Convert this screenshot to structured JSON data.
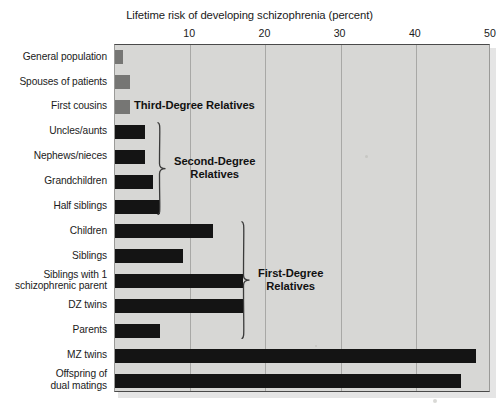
{
  "chart_data": {
    "type": "bar",
    "orientation": "horizontal",
    "title": "Lifetime risk of developing schizophrenia (percent)",
    "xlabel": "Lifetime risk of developing schizophrenia (percent)",
    "ylabel": "",
    "xlim": [
      0,
      50
    ],
    "xticks": [
      10,
      20,
      30,
      40,
      50
    ],
    "xtick_labels": [
      "10",
      "20",
      "30",
      "40",
      "50"
    ],
    "grid": true,
    "legend": "none",
    "categories": [
      "General population",
      "Spouses of patients",
      "First cousins",
      "Uncles/aunts",
      "Nephews/nieces",
      "Grandchildren",
      "Half siblings",
      "Children",
      "Siblings",
      "Siblings with 1\nschizophrenic parent",
      "DZ twins",
      "Parents",
      "MZ twins",
      "Offspring of\ndual matings"
    ],
    "values": [
      1,
      2,
      2,
      4,
      4,
      5,
      6,
      13,
      9,
      17,
      17,
      6,
      48,
      46
    ],
    "bar_colors": [
      "#767674",
      "#767674",
      "#767674",
      "#141414",
      "#141414",
      "#141414",
      "#141414",
      "#141414",
      "#141414",
      "#141414",
      "#141414",
      "#141414",
      "#141414",
      "#141414"
    ],
    "annotations": [
      {
        "label": "Third-Degree Relatives",
        "type": "text",
        "group_rows": [
          2
        ]
      },
      {
        "label": "Second-Degree\nRelatives",
        "type": "bracket",
        "group_rows": [
          3,
          4,
          5,
          6
        ]
      },
      {
        "label": "First-Degree\nRelatives",
        "type": "bracket",
        "group_rows": [
          7,
          8,
          9,
          10,
          11
        ]
      }
    ]
  },
  "colors": {
    "plot_background": "#d7d7d5",
    "gridline": "#a8a8a6",
    "axis": "#4a4a4a",
    "bar_gray": "#767674",
    "bar_black": "#141414",
    "text": "#1b1b1b",
    "annotation_text": "#111111",
    "page_background": "#ffffff"
  },
  "annotations_text": {
    "third_degree": "Third-Degree Relatives",
    "second_degree": "Second-Degree\nRelatives",
    "first_degree": "First-Degree\nRelatives"
  }
}
